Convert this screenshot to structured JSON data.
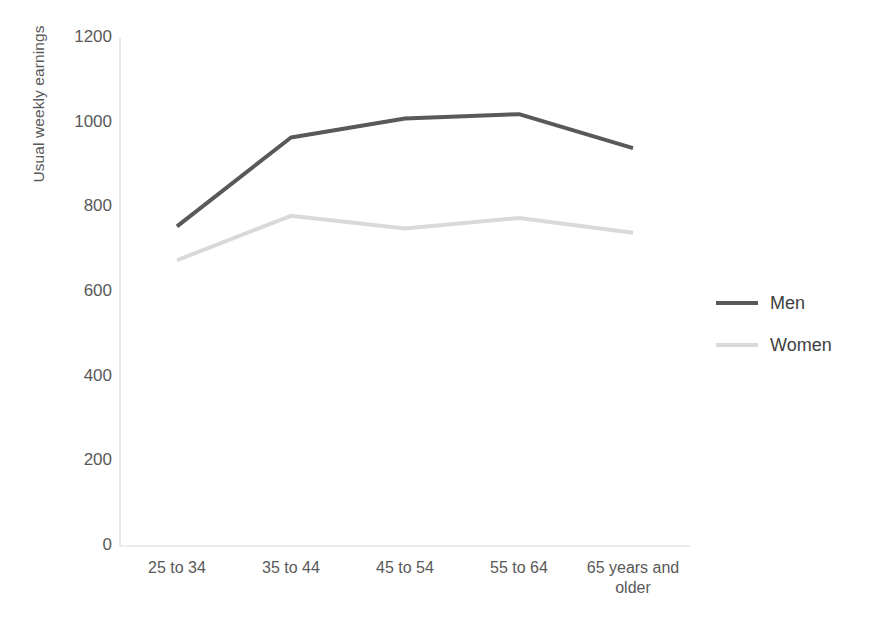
{
  "chart_data": {
    "type": "line",
    "title": "",
    "xlabel": "",
    "ylabel": "Usual weekly earnings",
    "categories": [
      "25 to 34",
      "35 to 44",
      "45 to 54",
      "55 to 64",
      "65 years and older"
    ],
    "series": [
      {
        "name": "Men",
        "color": "#595959",
        "values": [
          755,
          965,
          1010,
          1020,
          940
        ]
      },
      {
        "name": "Women",
        "color": "#d9d9d9",
        "values": [
          675,
          780,
          750,
          775,
          740
        ]
      }
    ],
    "ylim": [
      0,
      1200
    ],
    "yticks": [
      0,
      200,
      400,
      600,
      800,
      1000,
      1200
    ],
    "ytick_labels": [
      "0",
      "200",
      "400",
      "600",
      "800",
      "1000",
      "1200"
    ],
    "grid": false,
    "legend_position": "right",
    "axis_color": "#d9d9d9",
    "background": "#ffffff"
  },
  "legend": {
    "entries": [
      {
        "label": "Men"
      },
      {
        "label": "Women"
      }
    ]
  },
  "axes": {
    "y_title": "Usual weekly earnings"
  }
}
